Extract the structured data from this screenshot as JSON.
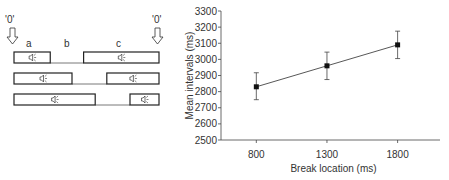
{
  "diagram": {
    "zero_label_left": "'0'",
    "zero_label_right": "'0'",
    "segment_labels": [
      "a",
      "b",
      "c"
    ],
    "sound_icon": "speaker-icon",
    "rows": [
      {
        "first_end_frac": 0.25,
        "second_start_frac": 0.48
      },
      {
        "first_end_frac": 0.4,
        "second_start_frac": 0.64
      },
      {
        "first_end_frac": 0.56,
        "second_start_frac": 0.8
      }
    ]
  },
  "chart_data": {
    "type": "line",
    "title": "",
    "xlabel": "Break location (ms)",
    "ylabel": "Mean intervals (ms)",
    "x": [
      800,
      1300,
      1800
    ],
    "categories": [
      "800",
      "1300",
      "1800"
    ],
    "series": [
      {
        "name": "Mean intervals",
        "values": [
          2830,
          2960,
          3090
        ],
        "error_low": [
          2750,
          2875,
          3005
        ],
        "error_high": [
          2917,
          3045,
          3175
        ],
        "marker": "square"
      }
    ],
    "ylim": [
      2500,
      3300
    ],
    "yticks": [
      2500,
      2600,
      2700,
      2800,
      2900,
      3000,
      3100,
      3200,
      3300
    ],
    "xticks": [
      800,
      1300,
      1800
    ],
    "xlim": [
      550,
      2100
    ],
    "grid": false,
    "legend": "none"
  }
}
